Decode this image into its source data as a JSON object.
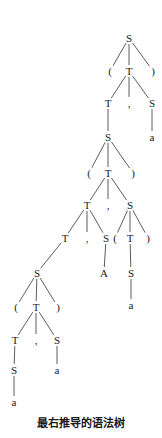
{
  "diagram": {
    "type": "parse-tree",
    "caption": "最右推导的语法树",
    "nodes": [
      {
        "id": "n0",
        "label": "S",
        "x": 129,
        "y": 38
      },
      {
        "id": "n1",
        "label": "(",
        "x": 110,
        "y": 71
      },
      {
        "id": "n2",
        "label": "T",
        "x": 129,
        "y": 71
      },
      {
        "id": "n3",
        "label": ")",
        "x": 153,
        "y": 71
      },
      {
        "id": "n4",
        "label": "T",
        "x": 108,
        "y": 103
      },
      {
        "id": "n5",
        "label": ",",
        "x": 129,
        "y": 103
      },
      {
        "id": "n6",
        "label": "S",
        "x": 152,
        "y": 103
      },
      {
        "id": "n7",
        "label": "a",
        "x": 152,
        "y": 137
      },
      {
        "id": "n8",
        "label": "S",
        "x": 108,
        "y": 137
      },
      {
        "id": "n9",
        "label": "(",
        "x": 89,
        "y": 173
      },
      {
        "id": "n10",
        "label": "T",
        "x": 108,
        "y": 173
      },
      {
        "id": "n11",
        "label": ")",
        "x": 133,
        "y": 173
      },
      {
        "id": "n12",
        "label": "T",
        "x": 87,
        "y": 205
      },
      {
        "id": "n13",
        "label": ",",
        "x": 108,
        "y": 205
      },
      {
        "id": "n14",
        "label": "S",
        "x": 130,
        "y": 205
      },
      {
        "id": "n15",
        "label": "T",
        "x": 65,
        "y": 238
      },
      {
        "id": "n16",
        "label": ",",
        "x": 87,
        "y": 238
      },
      {
        "id": "n17",
        "label": "S",
        "x": 106,
        "y": 238
      },
      {
        "id": "n18",
        "label": "(",
        "x": 115,
        "y": 238
      },
      {
        "id": "n19",
        "label": "T",
        "x": 130,
        "y": 238
      },
      {
        "id": "n20",
        "label": ")",
        "x": 148,
        "y": 238
      },
      {
        "id": "n21",
        "label": "A",
        "x": 104,
        "y": 273
      },
      {
        "id": "n22",
        "label": "S",
        "x": 131,
        "y": 273
      },
      {
        "id": "n23",
        "label": "a",
        "x": 131,
        "y": 305
      },
      {
        "id": "n24",
        "label": "S",
        "x": 37,
        "y": 273
      },
      {
        "id": "n25",
        "label": "(",
        "x": 16,
        "y": 307
      },
      {
        "id": "n26",
        "label": "T",
        "x": 36,
        "y": 307
      },
      {
        "id": "n27",
        "label": ")",
        "x": 58,
        "y": 307
      },
      {
        "id": "n28",
        "label": "T",
        "x": 15,
        "y": 340
      },
      {
        "id": "n29",
        "label": ",",
        "x": 36,
        "y": 340
      },
      {
        "id": "n30",
        "label": "S",
        "x": 57,
        "y": 340
      },
      {
        "id": "n31",
        "label": "S",
        "x": 14,
        "y": 370
      },
      {
        "id": "n32",
        "label": "a",
        "x": 57,
        "y": 370
      },
      {
        "id": "n33",
        "label": "a",
        "x": 14,
        "y": 402
      }
    ],
    "edges": [
      [
        "n0",
        "n1"
      ],
      [
        "n0",
        "n2"
      ],
      [
        "n0",
        "n3"
      ],
      [
        "n2",
        "n4"
      ],
      [
        "n2",
        "n5"
      ],
      [
        "n2",
        "n6"
      ],
      [
        "n6",
        "n7"
      ],
      [
        "n4",
        "n8"
      ],
      [
        "n8",
        "n9"
      ],
      [
        "n8",
        "n10"
      ],
      [
        "n8",
        "n11"
      ],
      [
        "n10",
        "n12"
      ],
      [
        "n10",
        "n13"
      ],
      [
        "n10",
        "n14"
      ],
      [
        "n12",
        "n15"
      ],
      [
        "n12",
        "n16"
      ],
      [
        "n12",
        "n17"
      ],
      [
        "n14",
        "n18"
      ],
      [
        "n14",
        "n19"
      ],
      [
        "n14",
        "n20"
      ],
      [
        "n17",
        "n21"
      ],
      [
        "n19",
        "n22"
      ],
      [
        "n22",
        "n23"
      ],
      [
        "n15",
        "n24"
      ],
      [
        "n24",
        "n25"
      ],
      [
        "n24",
        "n26"
      ],
      [
        "n24",
        "n27"
      ],
      [
        "n26",
        "n28"
      ],
      [
        "n26",
        "n29"
      ],
      [
        "n26",
        "n30"
      ],
      [
        "n28",
        "n31"
      ],
      [
        "n31",
        "n33"
      ],
      [
        "n30",
        "n32"
      ]
    ]
  }
}
